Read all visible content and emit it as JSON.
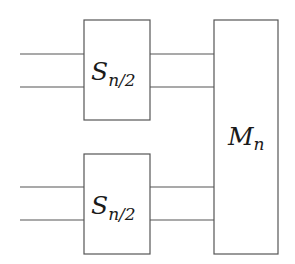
{
  "diagram": {
    "type": "block-diagram",
    "blocks": [
      {
        "id": "s_top",
        "label": "S",
        "subscript": "n/2"
      },
      {
        "id": "s_bottom",
        "label": "S",
        "subscript": "n/2"
      },
      {
        "id": "m",
        "label": "M",
        "subscript": "n"
      }
    ],
    "connections": [
      {
        "from": "input",
        "to": "s_top",
        "count": 2
      },
      {
        "from": "input",
        "to": "s_bottom",
        "count": 2
      },
      {
        "from": "s_top",
        "to": "m",
        "count": 2
      },
      {
        "from": "s_bottom",
        "to": "m",
        "count": 2
      }
    ],
    "colors": {
      "stroke": "#555555",
      "text": "#1a1a1a",
      "background": "#ffffff"
    }
  }
}
